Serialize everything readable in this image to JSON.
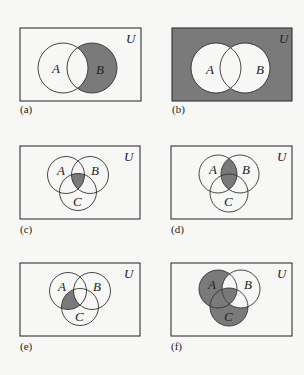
{
  "shade_color": "#7a7a7a",
  "background_color": "#f7f7f5",
  "universe_label": "U",
  "diagrams": [
    {
      "caption": "(a)",
      "sets": [
        "A",
        "B"
      ],
      "shaded_region": "B − A"
    },
    {
      "caption": "(b)",
      "sets": [
        "A",
        "B"
      ],
      "shaded_region": "(A ∪ B)′"
    },
    {
      "caption": "(c)",
      "sets": [
        "A",
        "B",
        "C"
      ],
      "shaded_region": "A ∩ B ∩ C"
    },
    {
      "caption": "(d)",
      "sets": [
        "A",
        "B",
        "C"
      ],
      "shaded_region": "A ∩ B"
    },
    {
      "caption": "(e)",
      "sets": [
        "A",
        "B",
        "C"
      ],
      "shaded_region": "(A ∩ C) − B"
    },
    {
      "caption": "(f)",
      "sets": [
        "A",
        "B",
        "C"
      ],
      "shaded_region": "(A ∪ C) − (B − (A ∩ C))"
    }
  ]
}
